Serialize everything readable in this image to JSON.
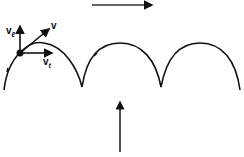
{
  "diagram": {
    "labels": {
      "v": "v",
      "vl_base": "v",
      "vl_sub": "ℓ",
      "vt_base": "v",
      "vt_sub": "t"
    },
    "colors": {
      "stroke": "#111111",
      "background": "#ffffff"
    }
  }
}
